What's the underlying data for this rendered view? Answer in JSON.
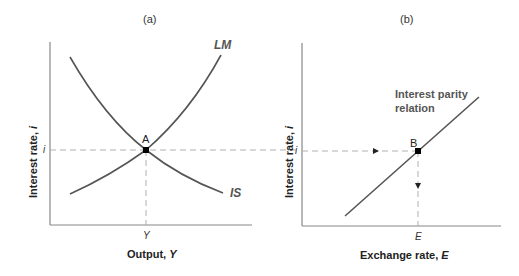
{
  "panels": [
    {
      "id": "a",
      "title": "(a)",
      "x_axis_label": "Output, ",
      "x_axis_var": "Y",
      "y_axis_label": "Interest rate, ",
      "y_axis_var": "i",
      "x_tick": "Y",
      "y_tick": "i",
      "curves": [
        {
          "name": "LM",
          "label": "LM",
          "slope": "upward"
        },
        {
          "name": "IS",
          "label": "IS",
          "slope": "downward"
        }
      ],
      "equilibrium_point": "A"
    },
    {
      "id": "b",
      "title": "(b)",
      "x_axis_label": "Exchange rate, ",
      "x_axis_var": "E",
      "y_axis_label": "Interest rate, ",
      "y_axis_var": "i",
      "x_tick": "E",
      "y_tick": "i",
      "curves": [
        {
          "name": "interest-parity",
          "label_line1": "Interest parity",
          "label_line2": "relation",
          "slope": "upward"
        }
      ],
      "equilibrium_point": "B"
    }
  ],
  "colors": {
    "curve": "#555555",
    "axis": "#888888",
    "dashed": "#aaaaaa",
    "point": "#000000"
  }
}
